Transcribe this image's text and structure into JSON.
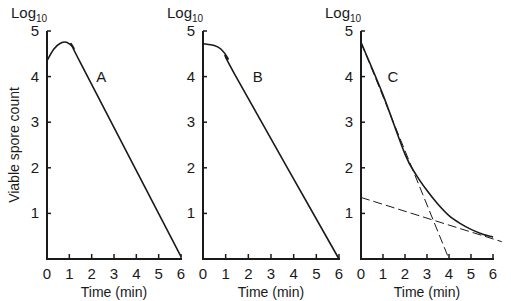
{
  "figure": {
    "y_axis_unit": "Log",
    "y_axis_unit_sub": "10",
    "ylabel": "Viable spore count",
    "xlabel": "Time (min)"
  },
  "chart_data": [
    {
      "type": "line",
      "panel": "A",
      "title": "",
      "xlabel": "Time (min)",
      "ylabel": "Viable spore count (Log10)",
      "x_ticks": [
        "0",
        "1",
        "2",
        "3",
        "4",
        "5",
        "6"
      ],
      "y_ticks": [
        "1",
        "2",
        "3",
        "4",
        "5"
      ],
      "xlim": [
        0,
        6
      ],
      "ylim": [
        0,
        5
      ],
      "grid": false,
      "series": [
        {
          "name": "A",
          "style": "solid",
          "x": [
            0,
            0.3,
            0.6,
            0.9,
            1.2,
            1.5,
            6
          ],
          "y": [
            4.35,
            4.6,
            4.73,
            4.75,
            4.62,
            4.3,
            0.05
          ]
        }
      ],
      "annotations": [
        {
          "text": "A",
          "x": 2.2,
          "y": 4.0
        }
      ]
    },
    {
      "type": "line",
      "panel": "B",
      "title": "",
      "xlabel": "Time (min)",
      "ylabel": "Log10",
      "x_ticks": [
        "0",
        "1",
        "2",
        "3",
        "4",
        "5",
        "6"
      ],
      "y_ticks": [
        "1",
        "2",
        "3",
        "4",
        "5"
      ],
      "xlim": [
        0,
        6
      ],
      "ylim": [
        0,
        5
      ],
      "grid": false,
      "series": [
        {
          "name": "B",
          "style": "solid",
          "x": [
            0,
            0.5,
            0.8,
            1.1,
            1.4,
            6
          ],
          "y": [
            4.72,
            4.68,
            4.6,
            4.4,
            4.05,
            0.0
          ]
        }
      ],
      "annotations": [
        {
          "text": "B",
          "x": 2.2,
          "y": 4.0
        }
      ]
    },
    {
      "type": "line",
      "panel": "C",
      "title": "",
      "xlabel": "Time (min)",
      "ylabel": "Log10",
      "x_ticks": [
        "0",
        "1",
        "2",
        "3",
        "4",
        "5",
        "6"
      ],
      "y_ticks": [
        "1",
        "2",
        "3",
        "4",
        "5"
      ],
      "xlim": [
        0,
        6
      ],
      "ylim": [
        0,
        5
      ],
      "grid": false,
      "series": [
        {
          "name": "C (observed)",
          "style": "solid",
          "x": [
            0,
            1,
            2,
            2.5,
            3,
            3.5,
            4,
            4.5,
            5,
            5.5,
            6
          ],
          "y": [
            4.75,
            3.6,
            2.3,
            1.85,
            1.5,
            1.2,
            0.95,
            0.78,
            0.65,
            0.55,
            0.48
          ]
        },
        {
          "name": "fast component (extrapolated)",
          "style": "dashed",
          "x": [
            0,
            4
          ],
          "y": [
            4.75,
            0.0
          ]
        },
        {
          "name": "slow component (extrapolated)",
          "style": "dashed",
          "x": [
            0,
            6.4
          ],
          "y": [
            1.35,
            0.38
          ]
        }
      ],
      "annotations": [
        {
          "text": "C",
          "x": 1.2,
          "y": 4.0
        }
      ]
    }
  ]
}
